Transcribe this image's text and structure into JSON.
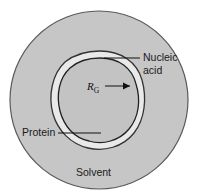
{
  "figure": {
    "labels": {
      "nucleic_acid_line1": "Nucleic",
      "nucleic_acid_line2": "acid",
      "protein": "Protein",
      "solvent": "Solvent",
      "radius_symbol": "R",
      "radius_subscript": "G"
    },
    "colors": {
      "background": "#ffffff",
      "solvent_fill": "#c6c6c6",
      "core_fill": "#c3c3c3",
      "shell_fill": "#e8e8e8",
      "outline": "#4a4a4a",
      "inner_outline": "#2e2e2e",
      "text": "#1a1a1a"
    },
    "geometry": {
      "outer_circle_center_x": 99,
      "outer_circle_center_y": 100,
      "outer_circle_radius": 90,
      "shell_band_width": 7
    }
  }
}
